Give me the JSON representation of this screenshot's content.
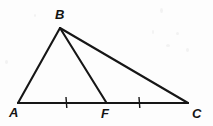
{
  "figure": {
    "background_color": "#fdfdfd",
    "stroke_color": "#161616",
    "label_color": "#141414",
    "width": 213,
    "height": 126,
    "points": {
      "A": {
        "label": "A",
        "x": 18,
        "y": 103,
        "label_x": 9,
        "label_y": 117
      },
      "B": {
        "label": "B",
        "x": 60,
        "y": 28,
        "label_x": 55,
        "label_y": 19
      },
      "C": {
        "label": "C",
        "x": 188,
        "y": 103,
        "label_x": 192,
        "label_y": 118
      },
      "F": {
        "label": "F",
        "x": 105,
        "y": 102,
        "label_x": 101,
        "label_y": 118
      }
    },
    "segments": [
      {
        "name": "segment-AB",
        "from": "A",
        "to": "B",
        "x1": 18,
        "y1": 103,
        "x2": 60,
        "y2": 28,
        "width": 2.1
      },
      {
        "name": "segment-BC",
        "from": "B",
        "to": "C",
        "x1": 60,
        "y1": 28,
        "x2": 188,
        "y2": 103,
        "width": 2.1
      },
      {
        "name": "segment-AC",
        "from": "A",
        "to": "C",
        "x1": 18,
        "y1": 103,
        "x2": 188,
        "y2": 103,
        "width": 2.2
      },
      {
        "name": "segment-BF",
        "from": "B",
        "to": "F",
        "x1": 60,
        "y1": 28,
        "x2": 106,
        "y2": 102,
        "width": 2.1
      }
    ],
    "tick_marks": [
      {
        "name": "tick-on-AF",
        "on_segment": "AF",
        "x": 66,
        "y1": 97,
        "y2": 108,
        "count": 1
      },
      {
        "name": "tick-on-FC",
        "on_segment": "FC",
        "x": 139,
        "y1": 97,
        "y2": 108,
        "count": 1
      }
    ],
    "congruence_note": "AF congruent to FC"
  }
}
